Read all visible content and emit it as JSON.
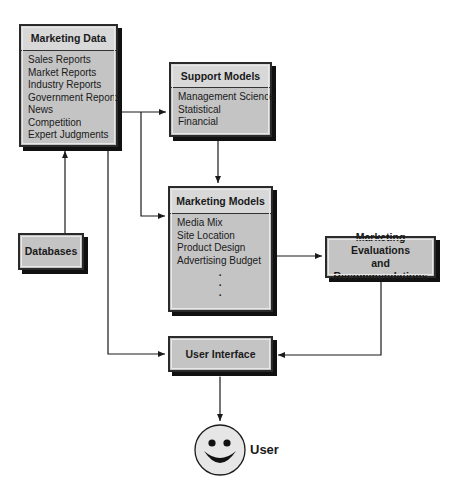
{
  "diagram": {
    "nodes": {
      "marketing_data": {
        "title": "Marketing Data",
        "items": [
          "Sales Reports",
          "Market Reports",
          "Industry Reports",
          "Government Reports",
          "News",
          "Competition",
          "Expert Judgments"
        ]
      },
      "support_models": {
        "title": "Support Models",
        "items": [
          "Management Science",
          "Statistical",
          "Financial"
        ]
      },
      "marketing_models": {
        "title": "Marketing Models",
        "items": [
          "Media Mix",
          "Site Location",
          "Product Design",
          "Advertising Budget"
        ],
        "ellipsis": [
          "·",
          "·",
          "·"
        ]
      },
      "evaluations": {
        "line1": "Marketing Evaluations",
        "line2": "and Recommendations"
      },
      "databases": {
        "title": "Databases"
      },
      "user_interface": {
        "title": "User Interface"
      },
      "user": {
        "label": "User",
        "icon": "smiley-face-icon"
      }
    },
    "edges": [
      {
        "from": "Databases",
        "to": "Marketing Data"
      },
      {
        "from": "Marketing Data",
        "to": "Support Models"
      },
      {
        "from": "Marketing Data",
        "to": "Marketing Models"
      },
      {
        "from": "Support Models",
        "to": "Marketing Models"
      },
      {
        "from": "Marketing Models",
        "to": "Marketing Evaluations and Recommendations"
      },
      {
        "from": "Marketing Data",
        "to": "User Interface"
      },
      {
        "from": "Marketing Evaluations and Recommendations",
        "to": "User Interface"
      },
      {
        "from": "User Interface",
        "to": "User",
        "bidirectional": true
      }
    ],
    "colors": {
      "box_fill": "#c4c4c4",
      "header_fill": "#d8d8d8",
      "border": "#2a2a2a",
      "shadow": "#111111",
      "line": "#1a1a1a",
      "smiley_fill": "#e6e6e6"
    }
  }
}
